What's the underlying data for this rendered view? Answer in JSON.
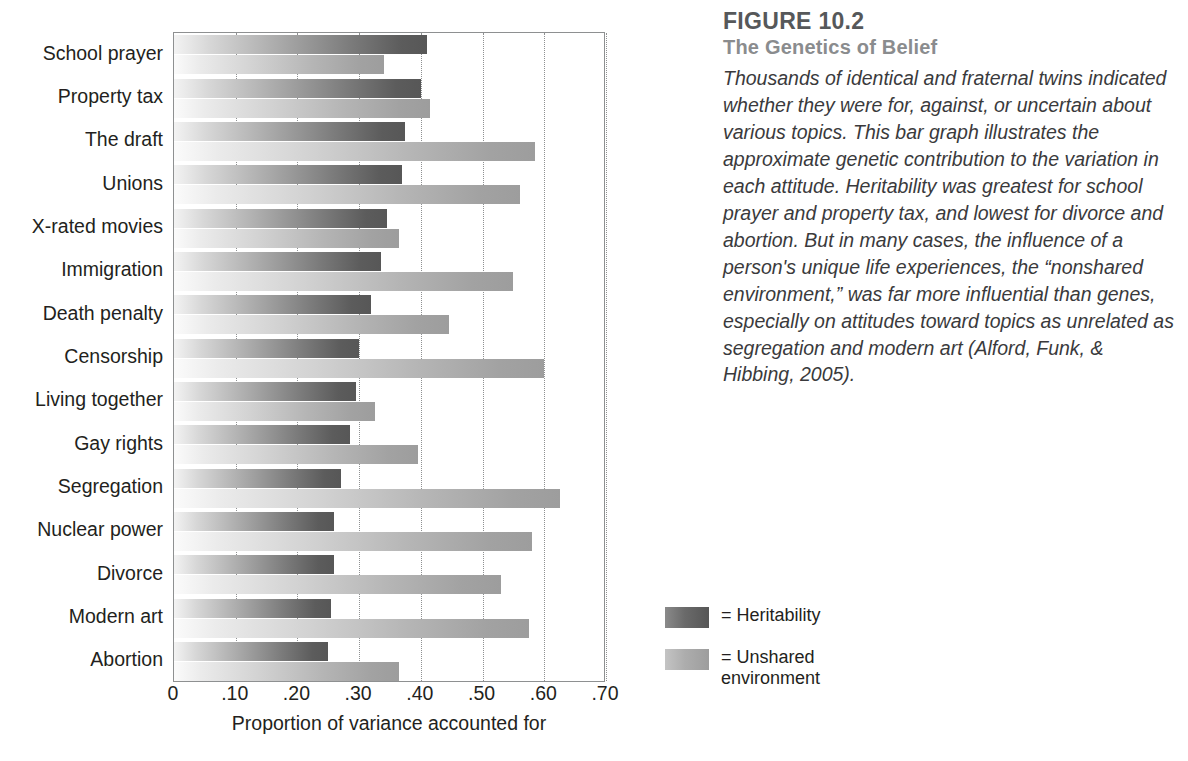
{
  "figure": {
    "number": "FIGURE 10.2",
    "title": "The Genetics of Belief",
    "body": "Thousands of identical and fraternal twins indicated whether they were for, against, or uncertain about various topics. This bar graph illustrates the approximate genetic contribution to the variation in each attitude.  Heritability was greatest for school prayer and property tax, and lowest for divorce and abortion. But in many cases, the influence of a person's unique life experiences, the “nonshared environment,” was far more influential than genes, especially on attitudes toward topics as unrelated as segregation and modern art (Alford, Funk, & Hibbing, 2005)."
  },
  "legend": {
    "heritability_label": "= Heritability",
    "unshared_label": "= Unshared\nenvironment"
  },
  "colors": {
    "heritability": "#575757",
    "unshared": "#9d9d9d",
    "axis": "#8e9091",
    "text": "#231f20",
    "fig_number": "#56585a",
    "fig_title": "#8a8c8e"
  },
  "chart_data": {
    "type": "bar",
    "orientation": "horizontal",
    "title": "The Genetics of Belief",
    "xlabel": "Proportion of variance accounted for",
    "ylabel": "",
    "xlim": [
      0,
      0.7
    ],
    "xticks": [
      0,
      0.1,
      0.2,
      0.3,
      0.4,
      0.5,
      0.6,
      0.7
    ],
    "xticklabels": [
      "0",
      ".10",
      ".20",
      ".30",
      ".40",
      ".50",
      ".60",
      ".70"
    ],
    "grid": "vertical-dotted",
    "legend_position": "right-below",
    "categories": [
      "School prayer",
      "Property tax",
      "The draft",
      "Unions",
      "X-rated movies",
      "Immigration",
      "Death penalty",
      "Censorship",
      "Living together",
      "Gay rights",
      "Segregation",
      "Nuclear power",
      "Divorce",
      "Modern art",
      "Abortion"
    ],
    "series": [
      {
        "name": "Heritability",
        "color": "#575757",
        "values": [
          0.41,
          0.4,
          0.375,
          0.37,
          0.345,
          0.335,
          0.32,
          0.3,
          0.295,
          0.285,
          0.27,
          0.26,
          0.26,
          0.255,
          0.25
        ]
      },
      {
        "name": "Unshared environment",
        "color": "#9d9d9d",
        "values": [
          0.34,
          0.415,
          0.585,
          0.56,
          0.365,
          0.55,
          0.445,
          0.6,
          0.325,
          0.395,
          0.625,
          0.58,
          0.53,
          0.575,
          0.365
        ]
      }
    ]
  }
}
